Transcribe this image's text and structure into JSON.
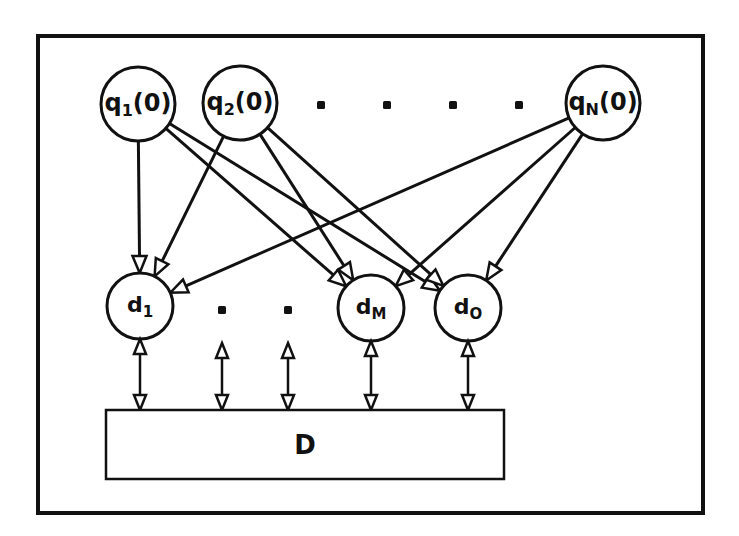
{
  "diagram": {
    "stroke_color": "#111111",
    "background": "#ffffff",
    "frame": {
      "x": 38,
      "y": 36,
      "w": 665,
      "h": 477
    },
    "query_nodes": [
      {
        "id": "q1",
        "label": "q",
        "sub": "1",
        "suffix": "(0)",
        "cx": 138,
        "cy": 104,
        "r": 37
      },
      {
        "id": "q2",
        "label": "q",
        "sub": "2",
        "suffix": "(0)",
        "cx": 240,
        "cy": 103,
        "r": 37
      },
      {
        "id": "qN",
        "label": "q",
        "sub": "N",
        "suffix": "(0)",
        "cx": 603,
        "cy": 103,
        "r": 37
      }
    ],
    "query_ellipsis_dots": [
      {
        "x": 321,
        "y": 105
      },
      {
        "x": 387,
        "y": 105
      },
      {
        "x": 453,
        "y": 105
      },
      {
        "x": 519,
        "y": 105
      }
    ],
    "data_nodes": [
      {
        "id": "d1",
        "label": "d",
        "sub": "1",
        "cx": 140,
        "cy": 306,
        "r": 33
      },
      {
        "id": "dM",
        "label": "d",
        "sub": "M",
        "cx": 371,
        "cy": 308,
        "r": 33
      },
      {
        "id": "dO",
        "label": "d",
        "sub": "O",
        "cx": 468,
        "cy": 308,
        "r": 33
      }
    ],
    "data_ellipsis_dots": [
      {
        "x": 222,
        "y": 310
      },
      {
        "x": 288,
        "y": 310
      }
    ],
    "edges": [
      {
        "from": "q1",
        "to": "d1"
      },
      {
        "from": "q1",
        "to": "dM"
      },
      {
        "from": "q1",
        "to": "dO"
      },
      {
        "from": "q2",
        "to": "d1"
      },
      {
        "from": "q2",
        "to": "dM"
      },
      {
        "from": "q2",
        "to": "dO"
      },
      {
        "from": "qN",
        "to": "d1"
      },
      {
        "from": "qN",
        "to": "dM"
      },
      {
        "from": "qN",
        "to": "dO"
      }
    ],
    "store": {
      "label": "D",
      "x": 106,
      "y": 410,
      "w": 398,
      "h": 69
    },
    "bidirectional_links_x": [
      140,
      222,
      288,
      371,
      468
    ],
    "bidirectional_top_y": [
      339,
      343,
      343,
      341,
      341
    ]
  }
}
